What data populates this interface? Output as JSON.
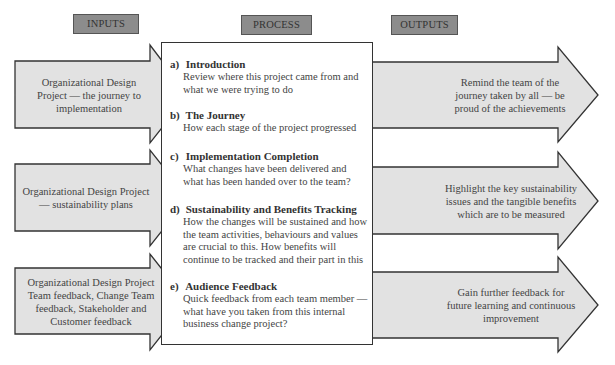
{
  "headers": {
    "inputs": "INPUTS",
    "process": "PROCESS",
    "outputs": "OUTPUTS"
  },
  "colors": {
    "header_fill": "#8c8c8c",
    "arrow_fill": "#e2e2e2",
    "outline": "#333333"
  },
  "inputs": [
    {
      "text": "Organizational Design Project — the journey to implementation"
    },
    {
      "text": "Organizational Design Project — sustainability plans"
    },
    {
      "text": "Organizational Design Project Team feedback, Change Team feedback, Stakeholder and Customer feedback"
    }
  ],
  "process": {
    "steps": [
      {
        "letter": "a)",
        "title": "Introduction",
        "desc": "Review where this project came from and what we were trying to do"
      },
      {
        "letter": "b)",
        "title": "The Journey",
        "desc": "How each stage of the project progressed"
      },
      {
        "letter": "c)",
        "title": "Implementation Completion",
        "desc": "What changes have been delivered and what has been handed over to the team?"
      },
      {
        "letter": "d)",
        "title": "Sustainability and Benefits Tracking",
        "desc": "How the changes will be sustained and how the team activities, behaviours and values are crucial to this.  How benefits will continue to be tracked and their part in this"
      },
      {
        "letter": "e)",
        "title": "Audience Feedback",
        "desc": "Quick feedback from each team member — what have you taken from this internal business change project?"
      }
    ]
  },
  "outputs": [
    {
      "text": "Remind the team of the journey taken by all — be proud of the achievements"
    },
    {
      "text": "Highlight the key sustainability issues and the tangible benefits which are to be measured"
    },
    {
      "text": "Gain further feedback for future learning and continuous improvement"
    }
  ]
}
